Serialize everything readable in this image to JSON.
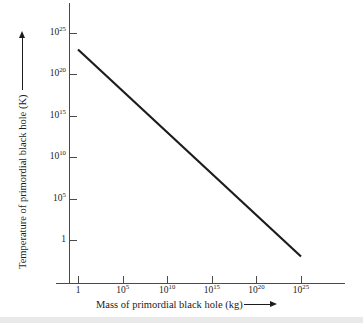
{
  "chart_data": {
    "type": "line",
    "title": "",
    "xlabel": "Mass of primordial black hole (kg)",
    "ylabel": "Temperature of primordial black hole (K)",
    "xscale": "log",
    "yscale": "log",
    "xlim": [
      1,
      1e+25
    ],
    "ylim": [
      1,
      1e+25
    ],
    "grid": false,
    "legend": null,
    "x_ticks": [
      {
        "value": 1,
        "mantissa": "1",
        "exponent": ""
      },
      {
        "value": 100000.0,
        "mantissa": "10",
        "exponent": "5"
      },
      {
        "value": 10000000000.0,
        "mantissa": "10",
        "exponent": "10"
      },
      {
        "value": 1000000000000000.0,
        "mantissa": "10",
        "exponent": "15"
      },
      {
        "value": 1e+20,
        "mantissa": "10",
        "exponent": "20"
      },
      {
        "value": 1e+25,
        "mantissa": "10",
        "exponent": "25"
      }
    ],
    "y_ticks": [
      {
        "value": 1e+25,
        "mantissa": "10",
        "exponent": "25"
      },
      {
        "value": 1e+20,
        "mantissa": "10",
        "exponent": "20"
      },
      {
        "value": 1000000000000000.0,
        "mantissa": "10",
        "exponent": "15"
      },
      {
        "value": 10000000000.0,
        "mantissa": "10",
        "exponent": "10"
      },
      {
        "value": 100000.0,
        "mantissa": "10",
        "exponent": "5"
      },
      {
        "value": 1,
        "mantissa": "1",
        "exponent": ""
      }
    ],
    "series": [
      {
        "name": "Hawking temperature",
        "relation": "T inversely proportional to M",
        "x": [
          1,
          100000.0,
          10000000000.0,
          1000000000000000.0,
          1e+20,
          1e+25
        ],
        "y": [
          1e+23,
          1e+18,
          10000000000000.0,
          100000000.0,
          1000,
          0.01
        ]
      }
    ],
    "annotations": [
      {
        "text": "x-axis arrow",
        "kind": "arrow",
        "direction": "right"
      },
      {
        "text": "y-axis arrow",
        "kind": "arrow",
        "direction": "up"
      }
    ],
    "axis_color": "#4a4a4a",
    "line_color": "#1c1c1c",
    "background": "#ffffff"
  }
}
